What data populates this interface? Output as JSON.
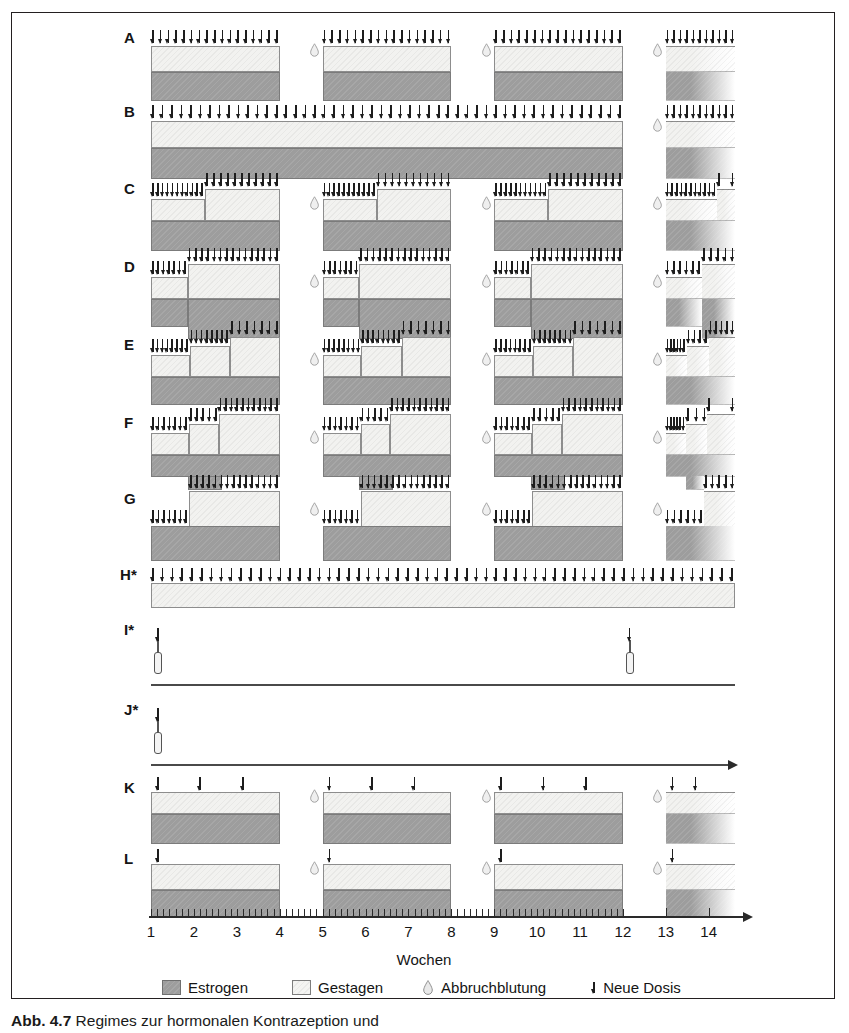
{
  "figure": {
    "rows": [
      {
        "id": "A",
        "label": "A",
        "type": "bars"
      },
      {
        "id": "B",
        "label": "B",
        "type": "bars"
      },
      {
        "id": "C",
        "label": "C",
        "type": "bars"
      },
      {
        "id": "D",
        "label": "D",
        "type": "bars"
      },
      {
        "id": "E",
        "label": "E",
        "type": "bars"
      },
      {
        "id": "F",
        "label": "F",
        "type": "bars"
      },
      {
        "id": "G",
        "label": "G",
        "type": "bars"
      },
      {
        "id": "H",
        "label": "H*",
        "type": "continuous"
      },
      {
        "id": "I",
        "label": "I*",
        "type": "injection"
      },
      {
        "id": "J",
        "label": "J*",
        "type": "injection"
      },
      {
        "id": "K",
        "label": "K",
        "type": "bars"
      },
      {
        "id": "L",
        "label": "L",
        "type": "bars"
      }
    ],
    "axis": {
      "label": "Wochen",
      "ticks": [
        "1",
        "2",
        "3",
        "4",
        "5",
        "6",
        "7",
        "8",
        "9",
        "10",
        "11",
        "12",
        "13",
        "14"
      ],
      "min": 1,
      "max": 14
    },
    "legend": [
      {
        "key": "estrogen",
        "label": "Estrogen",
        "icon": "filled-square",
        "color": "#9d9d9d"
      },
      {
        "key": "gestagen",
        "label": "Gestagen",
        "icon": "empty-square",
        "color": "#f4f4f2"
      },
      {
        "key": "abbruchblutung",
        "label": "Abbruchblutung",
        "icon": "drop-icon",
        "color": "#9a9a9a"
      },
      {
        "key": "neue_dosis",
        "label": "Neue Dosis",
        "icon": "arrow-down-icon",
        "color": "#1d1d1d"
      }
    ]
  },
  "chart_data": {
    "type": "table",
    "xlabel": "Wochen",
    "ylabel": "",
    "xlim": [
      1,
      14
    ],
    "grid": false,
    "legend_position": "bottom",
    "categories": [
      "1",
      "2",
      "3",
      "4",
      "5",
      "6",
      "7",
      "8",
      "9",
      "10",
      "11",
      "12",
      "13",
      "14"
    ],
    "series": [
      {
        "name": "A",
        "description": "Zyklisch: Estrogen + Gestagen gleichzeitig, 4-Wochen-Block, Abbruchblutung nach jedem Block",
        "blocks": [
          {
            "start": 1,
            "end": 4,
            "estrogen": true,
            "gestagen": true,
            "doses": 14
          },
          {
            "start": 5,
            "end": 8,
            "estrogen": true,
            "gestagen": true,
            "doses": 14
          },
          {
            "start": 9,
            "end": 12,
            "estrogen": true,
            "gestagen": true,
            "doses": 14
          },
          {
            "start": 13,
            "end": 14.6,
            "estrogen": true,
            "gestagen": true,
            "doses": 10,
            "fade": true
          }
        ],
        "bleeds": [
          4.6,
          8.6,
          12.6
        ]
      },
      {
        "name": "B",
        "description": "Kontinuierlich kombiniert ueber 12 Wochen, dann Fortsetzung",
        "blocks": [
          {
            "start": 1,
            "end": 12,
            "estrogen": true,
            "gestagen": true,
            "doses": 44
          },
          {
            "start": 13,
            "end": 14.6,
            "estrogen": true,
            "gestagen": true,
            "doses": 10,
            "fade": true
          }
        ],
        "bleeds": [
          12.6
        ]
      },
      {
        "name": "C",
        "description": "Estrogen durchgehend, Gestagen erhoeht in zweiter Zyklushaelfte",
        "blocks": [
          {
            "start": 1,
            "end": 4,
            "estrogen": true,
            "gestagen": "step-up",
            "doses": 22
          },
          {
            "start": 5,
            "end": 8,
            "estrogen": true,
            "gestagen": "step-up",
            "doses": 22
          },
          {
            "start": 9,
            "end": 12,
            "estrogen": true,
            "gestagen": "step-up",
            "doses": 22
          },
          {
            "start": 13,
            "end": 14.6,
            "estrogen": true,
            "gestagen": "step-up",
            "doses": 14,
            "fade": true
          }
        ],
        "bleeds": [
          4.6,
          8.6,
          12.6
        ]
      },
      {
        "name": "D",
        "description": "Estrogen stufenweise erhoeht, Gestagen erhoeht ab Woche 2",
        "blocks": [
          {
            "start": 1,
            "end": 4,
            "estrogen": "step-down",
            "gestagen": "step-up",
            "doses": 22
          },
          {
            "start": 5,
            "end": 8,
            "estrogen": "step-down",
            "gestagen": "step-up",
            "doses": 22
          },
          {
            "start": 9,
            "end": 12,
            "estrogen": "step-down",
            "gestagen": "step-up",
            "doses": 22
          },
          {
            "start": 13,
            "end": 14.6,
            "estrogen": "step-down",
            "gestagen": "step-up",
            "doses": 12,
            "fade": true
          }
        ],
        "bleeds": [
          4.6,
          8.6,
          12.6
        ]
      },
      {
        "name": "E",
        "description": "Gestagen in drei aufsteigenden Stufen",
        "blocks": [
          {
            "start": 1,
            "end": 4,
            "estrogen": true,
            "gestagen": "three-step",
            "doses": 22
          },
          {
            "start": 5,
            "end": 8,
            "estrogen": true,
            "gestagen": "three-step",
            "doses": 22
          },
          {
            "start": 9,
            "end": 12,
            "estrogen": true,
            "gestagen": "three-step",
            "doses": 22
          },
          {
            "start": 13,
            "end": 14.6,
            "estrogen": true,
            "gestagen": "three-step",
            "doses": 12,
            "fade": true
          }
        ],
        "bleeds": [
          4.6,
          8.6,
          12.6
        ]
      },
      {
        "name": "F",
        "description": "Gestagen dreistufig, Estrogen mit zusaetzlicher Stufe nach unten",
        "blocks": [
          {
            "start": 1,
            "end": 4,
            "estrogen": "notch",
            "gestagen": "three-step",
            "doses": 22
          },
          {
            "start": 5,
            "end": 8,
            "estrogen": "notch",
            "gestagen": "three-step",
            "doses": 22
          },
          {
            "start": 9,
            "end": 12,
            "estrogen": "notch",
            "gestagen": "three-step",
            "doses": 22
          },
          {
            "start": 13,
            "end": 14.6,
            "estrogen": "notch",
            "gestagen": "three-step",
            "doses": 12,
            "fade": true
          }
        ],
        "bleeds": [
          4.6,
          8.6,
          12.6
        ]
      },
      {
        "name": "G",
        "description": "Estrogen allein in Woche 1, danach Estrogen plus hoch dosiertes Gestagen",
        "blocks": [
          {
            "start": 1,
            "end": 4,
            "estrogen": true,
            "gestagen": "late-high",
            "doses": 22
          },
          {
            "start": 5,
            "end": 8,
            "estrogen": true,
            "gestagen": "late-high",
            "doses": 22
          },
          {
            "start": 9,
            "end": 12,
            "estrogen": true,
            "gestagen": "late-high",
            "doses": 22
          },
          {
            "start": 13,
            "end": 14.6,
            "estrogen": true,
            "gestagen": "late-high",
            "doses": 12,
            "fade": true
          }
        ],
        "bleeds": [
          4.6,
          8.6,
          12.6
        ]
      },
      {
        "name": "H*",
        "description": "Kontinuierliche Gestagen-Gabe ohne Abbruchblutung",
        "blocks": [
          {
            "start": 1,
            "end": 14.6,
            "estrogen": false,
            "gestagen": true,
            "doses": 60
          }
        ],
        "bleeds": []
      },
      {
        "name": "I*",
        "description": "Depot-Injektion zu Woche 1 und Woche 12",
        "injections": [
          1,
          12
        ],
        "bleeds": []
      },
      {
        "name": "J*",
        "description": "Einmalige Depot-Injektion zu Woche 1, Wirkung anhaltend",
        "injections": [
          1
        ],
        "bleeds": []
      },
      {
        "name": "K",
        "description": "Estrogen + Gestagen, drei Dosen pro 4-Wochen-Block",
        "blocks": [
          {
            "start": 1,
            "end": 4,
            "estrogen": true,
            "gestagen": true,
            "doses": 3
          },
          {
            "start": 5,
            "end": 8,
            "estrogen": true,
            "gestagen": true,
            "doses": 3
          },
          {
            "start": 9,
            "end": 12,
            "estrogen": true,
            "gestagen": true,
            "doses": 3
          },
          {
            "start": 13,
            "end": 14.6,
            "estrogen": true,
            "gestagen": true,
            "doses": 2,
            "fade": true
          }
        ],
        "bleeds": [
          4.6,
          8.6,
          12.6
        ]
      },
      {
        "name": "L",
        "description": "Estrogen + Gestagen, eine Dosis pro 4-Wochen-Block",
        "blocks": [
          {
            "start": 1,
            "end": 4,
            "estrogen": true,
            "gestagen": true,
            "doses": 1
          },
          {
            "start": 5,
            "end": 8,
            "estrogen": true,
            "gestagen": true,
            "doses": 1
          },
          {
            "start": 9,
            "end": 12,
            "estrogen": true,
            "gestagen": true,
            "doses": 1
          },
          {
            "start": 13,
            "end": 14.6,
            "estrogen": true,
            "gestagen": true,
            "doses": 1,
            "fade": true
          }
        ],
        "bleeds": [
          4.6,
          8.6,
          12.6
        ]
      }
    ],
    "annotations": [
      "Estrogen",
      "Gestagen",
      "Abbruchblutung",
      "Neue Dosis",
      "Wochen"
    ]
  },
  "caption": {
    "number": "Abb. 4.7",
    "text": "Regimes zur hormonalen Kontrazeption und"
  }
}
